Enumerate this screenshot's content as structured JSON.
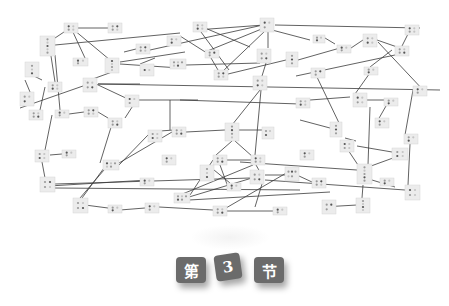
{
  "section_label": {
    "prefix": "第",
    "number": "3",
    "suffix": "节"
  },
  "colors": {
    "edge": "#3a3a3a",
    "node_fill": "#ececec",
    "tile": "#6b6b6b",
    "tile_text": "#ffffff"
  },
  "network": {
    "nodes": [
      {
        "id": "n1",
        "x": 64,
        "y": 23,
        "w": 14,
        "h": 10,
        "dots": 4
      },
      {
        "id": "n2",
        "x": 108,
        "y": 23,
        "w": 14,
        "h": 10,
        "dots": 4
      },
      {
        "id": "n3",
        "x": 40,
        "y": 36,
        "w": 15,
        "h": 20,
        "dots": 5
      },
      {
        "id": "n4",
        "x": 73,
        "y": 58,
        "w": 15,
        "h": 8,
        "dots": 3
      },
      {
        "id": "n5",
        "x": 105,
        "y": 58,
        "w": 14,
        "h": 15,
        "dots": 4
      },
      {
        "id": "n6",
        "x": 25,
        "y": 62,
        "w": 14,
        "h": 15,
        "dots": 3
      },
      {
        "id": "n7",
        "x": 48,
        "y": 82,
        "w": 14,
        "h": 10,
        "dots": 4
      },
      {
        "id": "n8",
        "x": 83,
        "y": 78,
        "w": 14,
        "h": 14,
        "dots": 4
      },
      {
        "id": "n9",
        "x": 20,
        "y": 92,
        "w": 14,
        "h": 14,
        "dots": 3
      },
      {
        "id": "n10",
        "x": 136,
        "y": 44,
        "w": 14,
        "h": 10,
        "dots": 4
      },
      {
        "id": "n11",
        "x": 193,
        "y": 22,
        "w": 14,
        "h": 10,
        "dots": 4
      },
      {
        "id": "n12",
        "x": 167,
        "y": 36,
        "w": 14,
        "h": 10,
        "dots": 3
      },
      {
        "id": "n13",
        "x": 260,
        "y": 18,
        "w": 14,
        "h": 14,
        "dots": 3
      },
      {
        "id": "n14",
        "x": 205,
        "y": 50,
        "w": 14,
        "h": 8,
        "dots": 3
      },
      {
        "id": "n15",
        "x": 170,
        "y": 59,
        "w": 16,
        "h": 10,
        "dots": 5
      },
      {
        "id": "n16",
        "x": 257,
        "y": 49,
        "w": 14,
        "h": 14,
        "dots": 4
      },
      {
        "id": "n17",
        "x": 140,
        "y": 64,
        "w": 14,
        "h": 12,
        "dots": 2
      },
      {
        "id": "n18",
        "x": 214,
        "y": 70,
        "w": 14,
        "h": 10,
        "dots": 4
      },
      {
        "id": "n19",
        "x": 253,
        "y": 76,
        "w": 14,
        "h": 14,
        "dots": 4
      },
      {
        "id": "n20",
        "x": 286,
        "y": 52,
        "w": 12,
        "h": 15,
        "dots": 3
      },
      {
        "id": "n21",
        "x": 313,
        "y": 35,
        "w": 12,
        "h": 8,
        "dots": 3
      },
      {
        "id": "n22",
        "x": 337,
        "y": 45,
        "w": 14,
        "h": 8,
        "dots": 3
      },
      {
        "id": "n23",
        "x": 363,
        "y": 34,
        "w": 14,
        "h": 13,
        "dots": 4
      },
      {
        "id": "n24",
        "x": 395,
        "y": 46,
        "w": 14,
        "h": 10,
        "dots": 4
      },
      {
        "id": "n25",
        "x": 405,
        "y": 25,
        "w": 14,
        "h": 10,
        "dots": 4
      },
      {
        "id": "n26",
        "x": 311,
        "y": 68,
        "w": 14,
        "h": 10,
        "dots": 3
      },
      {
        "id": "n27",
        "x": 364,
        "y": 67,
        "w": 14,
        "h": 8,
        "dots": 3
      },
      {
        "id": "n28",
        "x": 413,
        "y": 86,
        "w": 14,
        "h": 10,
        "dots": 3
      },
      {
        "id": "n29",
        "x": 353,
        "y": 93,
        "w": 14,
        "h": 14,
        "dots": 4
      },
      {
        "id": "n30",
        "x": 384,
        "y": 98,
        "w": 14,
        "h": 8,
        "dots": 3
      },
      {
        "id": "n31",
        "x": 296,
        "y": 98,
        "w": 14,
        "h": 10,
        "dots": 4
      },
      {
        "id": "n32",
        "x": 330,
        "y": 122,
        "w": 12,
        "h": 15,
        "dots": 3
      },
      {
        "id": "n33",
        "x": 340,
        "y": 140,
        "w": 14,
        "h": 12,
        "dots": 4
      },
      {
        "id": "n34",
        "x": 375,
        "y": 118,
        "w": 14,
        "h": 10,
        "dots": 3
      },
      {
        "id": "n35",
        "x": 392,
        "y": 148,
        "w": 16,
        "h": 12,
        "dots": 4
      },
      {
        "id": "n36",
        "x": 29,
        "y": 110,
        "w": 14,
        "h": 10,
        "dots": 4
      },
      {
        "id": "n37",
        "x": 55,
        "y": 110,
        "w": 14,
        "h": 8,
        "dots": 3
      },
      {
        "id": "n38",
        "x": 84,
        "y": 107,
        "w": 14,
        "h": 10,
        "dots": 4
      },
      {
        "id": "n39",
        "x": 35,
        "y": 150,
        "w": 14,
        "h": 12,
        "dots": 4
      },
      {
        "id": "n40",
        "x": 62,
        "y": 150,
        "w": 14,
        "h": 8,
        "dots": 3
      },
      {
        "id": "n41",
        "x": 103,
        "y": 160,
        "w": 16,
        "h": 10,
        "dots": 5
      },
      {
        "id": "n42",
        "x": 40,
        "y": 177,
        "w": 15,
        "h": 15,
        "dots": 4
      },
      {
        "id": "n43",
        "x": 140,
        "y": 178,
        "w": 14,
        "h": 8,
        "dots": 3
      },
      {
        "id": "n44",
        "x": 73,
        "y": 198,
        "w": 15,
        "h": 15,
        "dots": 4
      },
      {
        "id": "n45",
        "x": 108,
        "y": 205,
        "w": 14,
        "h": 8,
        "dots": 3
      },
      {
        "id": "n46",
        "x": 145,
        "y": 203,
        "w": 14,
        "h": 10,
        "dots": 3
      },
      {
        "id": "n47",
        "x": 148,
        "y": 130,
        "w": 14,
        "h": 12,
        "dots": 4
      },
      {
        "id": "n48",
        "x": 172,
        "y": 127,
        "w": 14,
        "h": 10,
        "dots": 4
      },
      {
        "id": "n49",
        "x": 162,
        "y": 155,
        "w": 14,
        "h": 10,
        "dots": 3
      },
      {
        "id": "n50",
        "x": 225,
        "y": 123,
        "w": 14,
        "h": 18,
        "dots": 4
      },
      {
        "id": "n51",
        "x": 262,
        "y": 127,
        "w": 12,
        "h": 12,
        "dots": 3
      },
      {
        "id": "n52",
        "x": 213,
        "y": 155,
        "w": 14,
        "h": 10,
        "dots": 4
      },
      {
        "id": "n53",
        "x": 251,
        "y": 155,
        "w": 14,
        "h": 10,
        "dots": 4
      },
      {
        "id": "n54",
        "x": 200,
        "y": 165,
        "w": 14,
        "h": 16,
        "dots": 3
      },
      {
        "id": "n55",
        "x": 227,
        "y": 183,
        "w": 14,
        "h": 8,
        "dots": 3
      },
      {
        "id": "n56",
        "x": 250,
        "y": 170,
        "w": 14,
        "h": 14,
        "dots": 4
      },
      {
        "id": "n57",
        "x": 285,
        "y": 167,
        "w": 14,
        "h": 14,
        "dots": 5
      },
      {
        "id": "n58",
        "x": 312,
        "y": 178,
        "w": 14,
        "h": 10,
        "dots": 4
      },
      {
        "id": "n59",
        "x": 174,
        "y": 193,
        "w": 16,
        "h": 10,
        "dots": 5
      },
      {
        "id": "n60",
        "x": 213,
        "y": 206,
        "w": 14,
        "h": 10,
        "dots": 4
      },
      {
        "id": "n61",
        "x": 273,
        "y": 207,
        "w": 14,
        "h": 8,
        "dots": 3
      },
      {
        "id": "n62",
        "x": 322,
        "y": 200,
        "w": 14,
        "h": 14,
        "dots": 3
      },
      {
        "id": "n63",
        "x": 356,
        "y": 198,
        "w": 14,
        "h": 15,
        "dots": 4
      },
      {
        "id": "n64",
        "x": 357,
        "y": 164,
        "w": 15,
        "h": 20,
        "dots": 5
      },
      {
        "id": "n65",
        "x": 405,
        "y": 185,
        "w": 15,
        "h": 15,
        "dots": 4
      },
      {
        "id": "n66",
        "x": 404,
        "y": 134,
        "w": 14,
        "h": 10,
        "dots": 3
      },
      {
        "id": "n67",
        "x": 125,
        "y": 95,
        "w": 14,
        "h": 12,
        "dots": 3
      },
      {
        "id": "n68",
        "x": 108,
        "y": 118,
        "w": 14,
        "h": 10,
        "dots": 4
      },
      {
        "id": "n69",
        "x": 380,
        "y": 178,
        "w": 14,
        "h": 8,
        "dots": 3
      },
      {
        "id": "n70",
        "x": 300,
        "y": 150,
        "w": 14,
        "h": 10,
        "dots": 3
      }
    ],
    "edges": [
      [
        78,
        28,
        108,
        28
      ],
      [
        67,
        30,
        52,
        40
      ],
      [
        72,
        30,
        85,
        58
      ],
      [
        74,
        30,
        110,
        60
      ],
      [
        55,
        45,
        180,
        33
      ],
      [
        51,
        56,
        55,
        82
      ],
      [
        55,
        55,
        60,
        110
      ],
      [
        34,
        76,
        42,
        80
      ],
      [
        25,
        80,
        30,
        92
      ],
      [
        45,
        87,
        40,
        110
      ],
      [
        112,
        72,
        90,
        80
      ],
      [
        120,
        62,
        185,
        52
      ],
      [
        120,
        64,
        180,
        68
      ],
      [
        136,
        49,
        124,
        52
      ],
      [
        186,
        65,
        260,
        63
      ],
      [
        196,
        30,
        264,
        25
      ],
      [
        205,
        28,
        250,
        47
      ],
      [
        201,
        32,
        229,
        70
      ],
      [
        263,
        25,
        150,
        50
      ],
      [
        264,
        28,
        205,
        52
      ],
      [
        266,
        30,
        222,
        72
      ],
      [
        272,
        30,
        310,
        40
      ],
      [
        275,
        25,
        420,
        28
      ],
      [
        268,
        30,
        268,
        48
      ],
      [
        266,
        63,
        262,
        76
      ],
      [
        260,
        90,
        228,
        130
      ],
      [
        261,
        90,
        255,
        155
      ],
      [
        155,
        58,
        140,
        64
      ],
      [
        98,
        84,
        140,
        84
      ],
      [
        83,
        86,
        20,
        108
      ],
      [
        98,
        84,
        440,
        90
      ],
      [
        180,
        36,
        210,
        55
      ],
      [
        211,
        58,
        218,
        70
      ],
      [
        228,
        74,
        286,
        60
      ],
      [
        298,
        60,
        340,
        48
      ],
      [
        325,
        38,
        335,
        44
      ],
      [
        351,
        48,
        363,
        40
      ],
      [
        377,
        40,
        400,
        48
      ],
      [
        410,
        30,
        402,
        46
      ],
      [
        378,
        42,
        425,
        92
      ],
      [
        392,
        50,
        370,
        67
      ],
      [
        372,
        70,
        355,
        94
      ],
      [
        395,
        55,
        296,
        76
      ],
      [
        310,
        100,
        350,
        97
      ],
      [
        367,
        100,
        390,
        100
      ],
      [
        316,
        75,
        340,
        125
      ],
      [
        330,
        128,
        300,
        120
      ],
      [
        345,
        138,
        356,
        141
      ],
      [
        357,
        146,
        392,
        152
      ],
      [
        370,
        107,
        368,
        165
      ],
      [
        386,
        106,
        378,
        120
      ],
      [
        413,
        90,
        405,
        135
      ],
      [
        410,
        144,
        408,
        185
      ],
      [
        404,
        154,
        360,
        170
      ],
      [
        360,
        168,
        344,
        144
      ],
      [
        52,
        115,
        45,
        150
      ],
      [
        69,
        114,
        84,
        112
      ],
      [
        98,
        112,
        108,
        118
      ],
      [
        42,
        162,
        45,
        178
      ],
      [
        50,
        155,
        62,
        154
      ],
      [
        112,
        124,
        100,
        163
      ],
      [
        119,
        165,
        148,
        135
      ],
      [
        119,
        163,
        172,
        132
      ],
      [
        49,
        186,
        148,
        180
      ],
      [
        55,
        184,
        250,
        178
      ],
      [
        55,
        188,
        300,
        190
      ],
      [
        85,
        205,
        108,
        208
      ],
      [
        120,
        210,
        145,
        208
      ],
      [
        159,
        207,
        213,
        210
      ],
      [
        227,
        211,
        273,
        211
      ],
      [
        189,
        197,
        252,
        178
      ],
      [
        189,
        200,
        330,
        192
      ],
      [
        180,
        195,
        253,
        165
      ],
      [
        80,
        198,
        104,
        170
      ],
      [
        82,
        198,
        104,
        168
      ],
      [
        160,
        131,
        174,
        130
      ],
      [
        186,
        132,
        225,
        130
      ],
      [
        239,
        130,
        262,
        130
      ],
      [
        232,
        141,
        216,
        155
      ],
      [
        235,
        141,
        253,
        157
      ],
      [
        227,
        160,
        251,
        160
      ],
      [
        256,
        165,
        260,
        172
      ],
      [
        265,
        175,
        285,
        175
      ],
      [
        299,
        176,
        312,
        182
      ],
      [
        214,
        170,
        230,
        183
      ],
      [
        220,
        165,
        228,
        187
      ],
      [
        213,
        160,
        190,
        195
      ],
      [
        288,
        172,
        226,
        208
      ],
      [
        262,
        184,
        255,
        207
      ],
      [
        322,
        205,
        336,
        207
      ],
      [
        357,
        205,
        322,
        207
      ],
      [
        362,
        198,
        363,
        185
      ],
      [
        240,
        162,
        357,
        170
      ],
      [
        265,
        180,
        405,
        190
      ],
      [
        395,
        187,
        372,
        180
      ],
      [
        136,
        101,
        125,
        118
      ],
      [
        130,
        100,
        96,
        84
      ],
      [
        139,
        100,
        198,
        100
      ],
      [
        180,
        100,
        300,
        104
      ],
      [
        170,
        100,
        170,
        130
      ]
    ]
  }
}
